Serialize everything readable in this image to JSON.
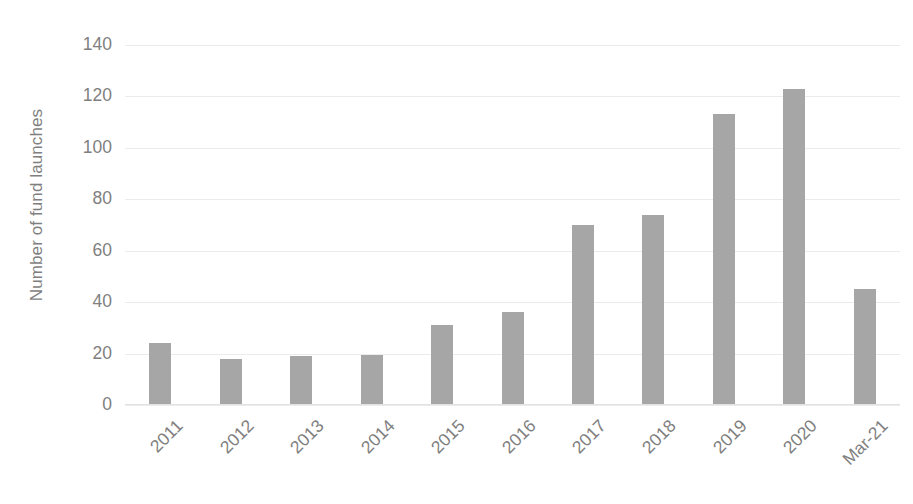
{
  "chart_data": {
    "type": "bar",
    "title": "",
    "subtitle": "",
    "xlabel": "",
    "ylabel": "Number of fund launches",
    "categories": [
      "2011",
      "2012",
      "2013",
      "2014",
      "2015",
      "2016",
      "2017",
      "2018",
      "2019",
      "2020",
      "Mar-21"
    ],
    "values": [
      24,
      18,
      19,
      19.5,
      31,
      36,
      70,
      74,
      113,
      123,
      45
    ],
    "series": [
      {
        "name": "Number of fund launches",
        "values": [
          24,
          18,
          19,
          19.5,
          31,
          36,
          70,
          74,
          113,
          123,
          45
        ]
      }
    ],
    "ylim": [
      0,
      140
    ],
    "y_ticks": [
      0,
      20,
      40,
      60,
      80,
      100,
      120,
      140
    ],
    "y_tick_labels": [
      "0",
      "20",
      "40",
      "60",
      "80",
      "100",
      "120",
      "140"
    ],
    "grid": true,
    "grid_axis": "y",
    "legend": false,
    "legend_position": "none",
    "bar_color": "#a6a6a6",
    "gridline_color": "#eceaea",
    "text_color": "#7f7f7f",
    "background_color": "#ffffff",
    "x_tick_rotation": -45,
    "annotations": []
  }
}
